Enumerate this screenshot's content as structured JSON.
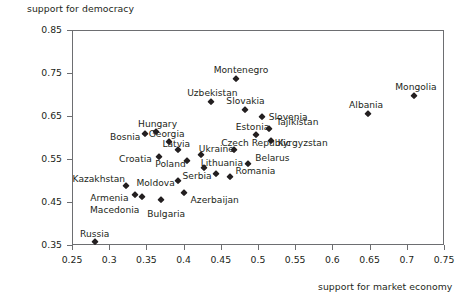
{
  "chart_data": {
    "type": "scatter",
    "title": "",
    "xlabel": "support for market economy",
    "ylabel": "support for democracy",
    "xlim": [
      0.25,
      0.75
    ],
    "ylim": [
      0.35,
      0.85
    ],
    "xticks": [
      "0.25",
      "0.3",
      "0.35",
      "0.4",
      "0.45",
      "0.5",
      "0.55",
      "0.6",
      "0.65",
      "0.7",
      "0.75"
    ],
    "xtick_values": [
      0.25,
      0.3,
      0.35,
      0.4,
      0.45,
      0.5,
      0.55,
      0.6,
      0.65,
      0.7,
      0.75
    ],
    "yticks": [
      "0.85",
      "0.75",
      "0.65",
      "0.55",
      "0.45",
      "0.35"
    ],
    "ytick_values": [
      0.85,
      0.75,
      0.65,
      0.55,
      0.45,
      0.35
    ],
    "grid": false,
    "legend": "none",
    "marker_shape": "diamond",
    "marker_color": "#231f20",
    "frame_color": "#6d6e71",
    "background": "#ffffff",
    "points": [
      {
        "name": "Montenegro",
        "x": 0.47,
        "y": 0.735,
        "label_dx": -22,
        "label_dy": -13
      },
      {
        "name": "Uzbekistan",
        "x": 0.437,
        "y": 0.682,
        "label_dx": -24,
        "label_dy": -13
      },
      {
        "name": "Mongolia",
        "x": 0.71,
        "y": 0.697,
        "label_dx": -19,
        "label_dy": -13
      },
      {
        "name": "Slovakia",
        "x": 0.483,
        "y": 0.665,
        "label_dx": -19,
        "label_dy": -13
      },
      {
        "name": "Albania",
        "x": 0.648,
        "y": 0.655,
        "label_dx": -19,
        "label_dy": -13
      },
      {
        "name": "Slovenia",
        "x": 0.505,
        "y": 0.648,
        "label_dx": 7,
        "label_dy": -4
      },
      {
        "name": "Tajikistan",
        "x": 0.515,
        "y": 0.62,
        "label_dx": 7,
        "label_dy": -11
      },
      {
        "name": "Estonia",
        "x": 0.497,
        "y": 0.605,
        "label_dx": -20,
        "label_dy": -12
      },
      {
        "name": "Hungary",
        "x": 0.363,
        "y": 0.612,
        "label_dx": -18,
        "label_dy": -12
      },
      {
        "name": "Bosnia",
        "x": 0.348,
        "y": 0.607,
        "label_dx": -35,
        "label_dy": -1
      },
      {
        "name": "Kyrgyzstan",
        "x": 0.517,
        "y": 0.592,
        "label_dx": 7,
        "label_dy": -2
      },
      {
        "name": "Georgia",
        "x": 0.38,
        "y": 0.59,
        "label_dx": -20,
        "label_dy": -12
      },
      {
        "name": "Latvia",
        "x": 0.393,
        "y": 0.57,
        "label_dx": -16,
        "label_dy": -10
      },
      {
        "name": "Ukraine",
        "x": 0.423,
        "y": 0.56,
        "label_dx": -2,
        "label_dy": -10
      },
      {
        "name": "Czech Republic",
        "x": 0.468,
        "y": 0.572,
        "label_dx": -13,
        "label_dy": -11
      },
      {
        "name": "Croatia",
        "x": 0.367,
        "y": 0.555,
        "label_dx": -40,
        "label_dy": -2
      },
      {
        "name": "Poland",
        "x": 0.405,
        "y": 0.545,
        "label_dx": -32,
        "label_dy": -1
      },
      {
        "name": "Belarus",
        "x": 0.487,
        "y": 0.538,
        "label_dx": 7,
        "label_dy": -10
      },
      {
        "name": "Lithuania",
        "x": 0.427,
        "y": 0.53,
        "label_dx": -3,
        "label_dy": -9
      },
      {
        "name": "Serbia",
        "x": 0.443,
        "y": 0.515,
        "label_dx": -33,
        "label_dy": -2
      },
      {
        "name": "Romania",
        "x": 0.463,
        "y": 0.507,
        "label_dx": 5,
        "label_dy": -10
      },
      {
        "name": "Moldova",
        "x": 0.393,
        "y": 0.5,
        "label_dx": -42,
        "label_dy": -2
      },
      {
        "name": "Kazakhstan",
        "x": 0.322,
        "y": 0.488,
        "label_dx": -53,
        "label_dy": -11
      },
      {
        "name": "Azerbaijan",
        "x": 0.4,
        "y": 0.472,
        "label_dx": 7,
        "label_dy": 3
      },
      {
        "name": "Armenia",
        "x": 0.335,
        "y": 0.466,
        "label_dx": -45,
        "label_dy": -1
      },
      {
        "name": "Macedonia",
        "x": 0.344,
        "y": 0.462,
        "label_dx": -52,
        "label_dy": 9
      },
      {
        "name": "Bulgaria",
        "x": 0.37,
        "y": 0.455,
        "label_dx": -14,
        "label_dy": 10
      },
      {
        "name": "Russia",
        "x": 0.281,
        "y": 0.358,
        "label_dx": -15,
        "label_dy": -12
      }
    ]
  }
}
